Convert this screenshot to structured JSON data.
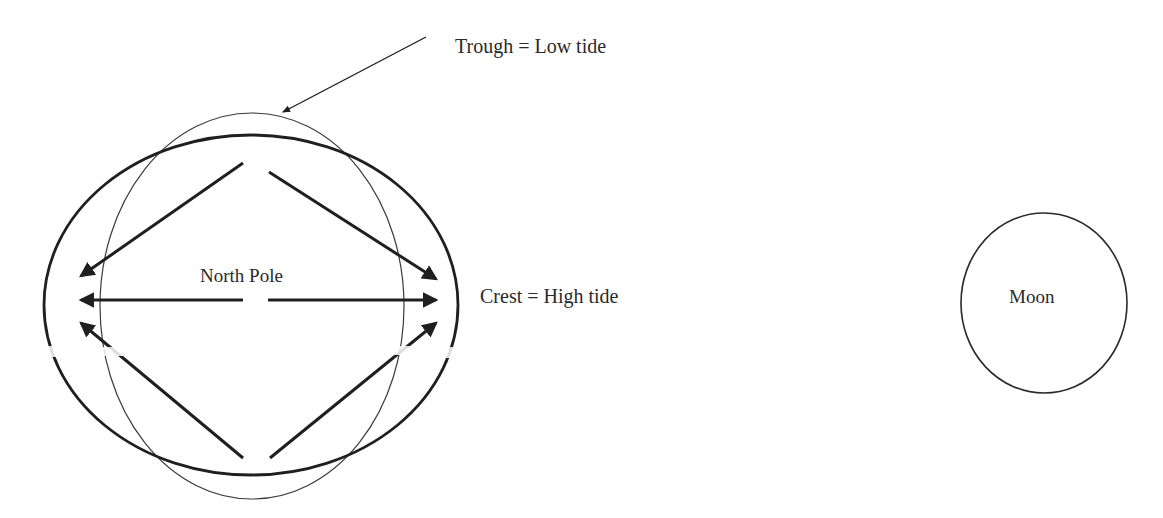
{
  "diagram": {
    "labels": {
      "trough": "Trough = Low tide",
      "crest": "Crest = High tide",
      "north_pole": "North Pole",
      "moon": "Moon"
    },
    "elements": {
      "earth_outline": "circle",
      "tidal_bulge": "ellipse elongated toward the Moon",
      "force_arrows": [
        "upper-left diagonal",
        "left horizontal",
        "lower-left diagonal",
        "upper-right diagonal",
        "right horizontal",
        "lower-right diagonal"
      ]
    },
    "colors": {
      "stroke": "#1f1f1f",
      "thin_stroke": "#3a3a3a",
      "text": "#2a2a2a",
      "background": "#ffffff"
    }
  }
}
